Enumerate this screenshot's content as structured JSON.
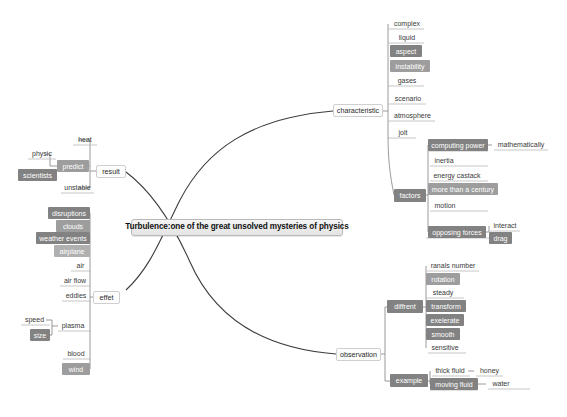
{
  "diagram": {
    "type": "mind-map",
    "root": {
      "label": "Turbulence:one of the great unsolved mysteries of physics",
      "style": "root",
      "x": 131,
      "y": 219,
      "w": 212,
      "h": 17
    },
    "colors": {
      "background": "#ffffff",
      "edge": "#3c3c3c",
      "rule": "#b8b8b8",
      "fill_dark": "#828282",
      "fill_mid": "#9d9d9d",
      "fill_light": "#b0b0b0",
      "root_border": "#b9b9b9",
      "branch_border": "#cfcfcf",
      "text_dark": "#3a3a3a",
      "text_light": "#ffffff"
    },
    "branches": [
      {
        "label": "result",
        "style": "branch",
        "x": 96,
        "y": 165,
        "w": 30,
        "h": 13
      },
      {
        "label": "effet",
        "style": "branch",
        "x": 93,
        "y": 291,
        "w": 27,
        "h": 13
      },
      {
        "label": "characteristic",
        "style": "branch",
        "x": 333,
        "y": 104,
        "w": 50,
        "h": 13
      },
      {
        "label": "observation",
        "style": "branch",
        "x": 336,
        "y": 348,
        "w": 45,
        "h": 13
      }
    ],
    "nodes": [
      {
        "label": "heat",
        "style": "leaf",
        "x": 73,
        "y": 134,
        "w": 24,
        "h": 11,
        "rule": true
      },
      {
        "label": "physic",
        "style": "leaf",
        "x": 28,
        "y": 148,
        "w": 28,
        "h": 11,
        "rule": true
      },
      {
        "label": "predict",
        "style": "fill-mid",
        "x": 57,
        "y": 160,
        "w": 32,
        "h": 12
      },
      {
        "label": "scientists",
        "style": "fill-dark",
        "x": 18,
        "y": 169,
        "w": 39,
        "h": 12
      },
      {
        "label": "unstable",
        "style": "leaf",
        "x": 61,
        "y": 182,
        "w": 33,
        "h": 11,
        "rule": true
      },
      {
        "label": "disruptions",
        "style": "fill-dark",
        "x": 48,
        "y": 207,
        "w": 42,
        "h": 12
      },
      {
        "label": "clouds",
        "style": "fill-mid",
        "x": 56,
        "y": 220,
        "w": 34,
        "h": 12
      },
      {
        "label": "weather events",
        "style": "fill-dark",
        "x": 36,
        "y": 232,
        "w": 54,
        "h": 12
      },
      {
        "label": "airplane",
        "style": "fill-light",
        "x": 54,
        "y": 245,
        "w": 36,
        "h": 12
      },
      {
        "label": "air",
        "style": "leaf",
        "x": 71,
        "y": 260,
        "w": 19,
        "h": 11,
        "rule": true
      },
      {
        "label": "air flow",
        "style": "leaf",
        "x": 60,
        "y": 275,
        "w": 30,
        "h": 11,
        "rule": true
      },
      {
        "label": "eddies",
        "style": "leaf",
        "x": 62,
        "y": 290,
        "w": 28,
        "h": 11,
        "rule": true
      },
      {
        "label": "speed",
        "style": "leaf",
        "x": 21,
        "y": 314,
        "w": 27,
        "h": 11,
        "rule": true
      },
      {
        "label": "plasma",
        "style": "leaf",
        "x": 58,
        "y": 320,
        "w": 30,
        "h": 11,
        "rule": true
      },
      {
        "label": "size",
        "style": "fill-dark",
        "x": 30,
        "y": 329,
        "w": 20,
        "h": 12
      },
      {
        "label": "blood",
        "style": "leaf",
        "x": 63,
        "y": 348,
        "w": 26,
        "h": 11,
        "rule": true
      },
      {
        "label": "wind",
        "style": "fill-mid",
        "x": 62,
        "y": 363,
        "w": 28,
        "h": 12
      },
      {
        "label": "complex",
        "style": "leaf",
        "x": 390,
        "y": 18,
        "w": 34,
        "h": 11,
        "rule": true
      },
      {
        "label": "liquid",
        "style": "leaf",
        "x": 390,
        "y": 32,
        "w": 34,
        "h": 11,
        "rule": true
      },
      {
        "label": "aspect",
        "style": "fill-dark",
        "x": 390,
        "y": 45,
        "w": 32,
        "h": 12
      },
      {
        "label": "instability",
        "style": "fill-mid",
        "x": 390,
        "y": 60,
        "w": 40,
        "h": 12
      },
      {
        "label": "gases",
        "style": "leaf",
        "x": 390,
        "y": 75,
        "w": 34,
        "h": 11,
        "rule": true
      },
      {
        "label": "scenario",
        "style": "leaf",
        "x": 390,
        "y": 93,
        "w": 36,
        "h": 11,
        "rule": true
      },
      {
        "label": "atmosphere",
        "style": "leaf",
        "x": 390,
        "y": 110,
        "w": 45,
        "h": 11,
        "rule": true
      },
      {
        "label": "jolt",
        "style": "leaf",
        "x": 390,
        "y": 127,
        "w": 26,
        "h": 11,
        "rule": true
      },
      {
        "label": "factors",
        "style": "fill-dark",
        "x": 394,
        "y": 189,
        "w": 32,
        "h": 13
      },
      {
        "label": "computing power",
        "style": "fill-dark",
        "x": 428,
        "y": 139,
        "w": 60,
        "h": 12
      },
      {
        "label": "mathematically",
        "style": "leaf",
        "x": 494,
        "y": 139,
        "w": 54,
        "h": 11,
        "rule": true
      },
      {
        "label": "inertia",
        "style": "leaf",
        "x": 430,
        "y": 155,
        "w": 28,
        "h": 11,
        "rule": true
      },
      {
        "label": "energy castack",
        "style": "leaf",
        "x": 430,
        "y": 170,
        "w": 54,
        "h": 11,
        "rule": true
      },
      {
        "label": "more than a century",
        "style": "fill-mid",
        "x": 428,
        "y": 183,
        "w": 70,
        "h": 12
      },
      {
        "label": "motion",
        "style": "leaf",
        "x": 430,
        "y": 200,
        "w": 30,
        "h": 11,
        "rule": true
      },
      {
        "label": "opposing forces",
        "style": "fill-dark",
        "x": 428,
        "y": 226,
        "w": 58,
        "h": 12
      },
      {
        "label": "interact",
        "style": "leaf",
        "x": 490,
        "y": 220,
        "w": 30,
        "h": 11,
        "rule": true
      },
      {
        "label": "drag",
        "style": "fill-dark",
        "x": 489,
        "y": 232,
        "w": 23,
        "h": 12
      },
      {
        "label": "diffrent",
        "style": "fill-dark",
        "x": 387,
        "y": 300,
        "w": 36,
        "h": 13
      },
      {
        "label": "ranals number",
        "style": "leaf",
        "x": 427,
        "y": 260,
        "w": 52,
        "h": 11,
        "rule": true
      },
      {
        "label": "rotation",
        "style": "fill-mid",
        "x": 426,
        "y": 273,
        "w": 34,
        "h": 12
      },
      {
        "label": "steady",
        "style": "leaf",
        "x": 428,
        "y": 287,
        "w": 30,
        "h": 11,
        "rule": true
      },
      {
        "label": "transform",
        "style": "fill-dark",
        "x": 426,
        "y": 300,
        "w": 40,
        "h": 12
      },
      {
        "label": "exelerate",
        "style": "fill-dark",
        "x": 426,
        "y": 314,
        "w": 38,
        "h": 12
      },
      {
        "label": "smooth",
        "style": "fill-dark",
        "x": 426,
        "y": 328,
        "w": 34,
        "h": 12
      },
      {
        "label": "sensitive",
        "style": "leaf",
        "x": 428,
        "y": 342,
        "w": 34,
        "h": 11,
        "rule": true
      },
      {
        "label": "example",
        "style": "fill-dark",
        "x": 390,
        "y": 374,
        "w": 38,
        "h": 13
      },
      {
        "label": "thick fluid",
        "style": "leaf",
        "x": 432,
        "y": 365,
        "w": 36,
        "h": 11,
        "rule": true
      },
      {
        "label": "honey",
        "style": "leaf",
        "x": 476,
        "y": 365,
        "w": 27,
        "h": 11,
        "rule": true
      },
      {
        "label": "moving fluid",
        "style": "fill-dark",
        "x": 430,
        "y": 378,
        "w": 48,
        "h": 12
      },
      {
        "label": "water",
        "style": "leaf",
        "x": 488,
        "y": 378,
        "w": 26,
        "h": 11,
        "rule": true
      }
    ]
  }
}
